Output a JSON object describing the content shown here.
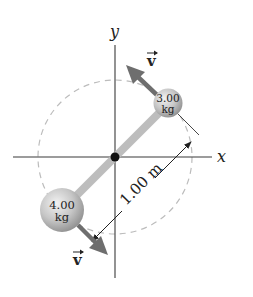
{
  "figure": {
    "axes": {
      "x_label": "x",
      "y_label": "y"
    },
    "masses": [
      {
        "id": "small",
        "value": "3.00",
        "unit": "kg"
      },
      {
        "id": "large",
        "value": "4.00",
        "unit": "kg"
      }
    ],
    "velocity_label": "v",
    "length_label": "1.00 m",
    "colors": {
      "axis": "#3a3a3a",
      "rod": "#bdbdbd",
      "ball": "#c4c4c4",
      "arrow": "#6e6e6e",
      "dashed_circle": "#bcbcbc",
      "pivot": "#111111"
    }
  }
}
